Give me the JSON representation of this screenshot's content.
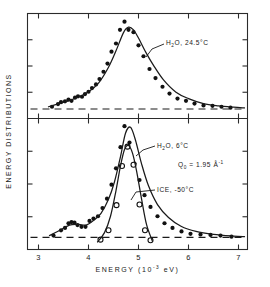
{
  "figure": {
    "title_visible": false,
    "y_axis_label": "ENERGY DISTRIBUTIONS",
    "x_axis_label_main": "ENERGY",
    "x_axis_label_unit_open": "(10",
    "x_axis_label_unit_exp": "-3",
    "x_axis_label_unit_close": " eV)",
    "x_ticks": [
      3,
      4,
      5,
      6,
      7
    ],
    "x_tick_labels": [
      "3",
      "4",
      "5",
      "6",
      "7"
    ],
    "x_minor_step": 0.5,
    "x_range": [
      2.78,
      7.18
    ],
    "n_panels": 2
  },
  "annotations": {
    "top_label": {
      "text": "H₂O,  24.5°C",
      "prefix": "H",
      "sub": "2",
      "suffix": "O,  24.5°C"
    },
    "mid_label": {
      "text": "H₂O,  6°C",
      "prefix": "H",
      "sub": "2",
      "suffix": "O,  6°C"
    },
    "q_label": {
      "text": "Q₀ = 1.95 Å⁻¹",
      "symbol": "Q",
      "sub": "0",
      "equals": " = 1.95 ",
      "unit": "Å",
      "exp": "-1"
    },
    "ice_label": {
      "text": "ICE, -50°C"
    }
  },
  "chart_data": [
    {
      "type": "scatter",
      "panel": "top",
      "title": "H₂O, 24.5°C",
      "xlabel": "ENERGY (10^-3 eV)",
      "ylabel": "ENERGY DISTRIBUTIONS",
      "xlim": [
        2.78,
        7.18
      ],
      "ylim": [
        0,
        1.14
      ],
      "grid": false,
      "legend": "none",
      "marker": "filled-circle",
      "baseline_y": 0.06,
      "series": [
        {
          "name": "H2O 24.5C points",
          "marker": "filled-circle",
          "x": [
            3.27,
            3.39,
            3.45,
            3.53,
            3.6,
            3.66,
            3.73,
            3.79,
            3.87,
            3.93,
            4.0,
            4.07,
            4.15,
            4.22,
            4.3,
            4.38,
            4.46,
            4.55,
            4.63,
            4.72,
            4.8,
            4.9,
            5.0,
            5.1,
            5.22,
            5.34,
            5.48,
            5.62,
            5.78,
            5.95,
            6.12,
            6.3,
            6.48,
            6.66,
            6.84
          ],
          "y": [
            0.085,
            0.115,
            0.135,
            0.145,
            0.165,
            0.15,
            0.185,
            0.2,
            0.195,
            0.225,
            0.25,
            0.29,
            0.33,
            0.39,
            0.47,
            0.56,
            0.69,
            0.78,
            0.93,
            1.02,
            0.93,
            0.905,
            0.76,
            0.64,
            0.5,
            0.4,
            0.305,
            0.23,
            0.175,
            0.15,
            0.12,
            0.1,
            0.095,
            0.085,
            0.075
          ]
        },
        {
          "name": "H2O 24.5C fitted curve",
          "type": "line",
          "x": [
            3.2,
            3.4,
            3.6,
            3.8,
            4.0,
            4.2,
            4.4,
            4.55,
            4.7,
            4.8,
            4.9,
            5.0,
            5.15,
            5.3,
            5.5,
            5.75,
            6.0,
            6.3,
            6.6,
            6.9,
            7.12
          ],
          "y": [
            0.085,
            0.118,
            0.15,
            0.192,
            0.25,
            0.345,
            0.52,
            0.7,
            0.9,
            0.96,
            0.93,
            0.84,
            0.68,
            0.54,
            0.38,
            0.245,
            0.175,
            0.12,
            0.095,
            0.08,
            0.072
          ]
        }
      ]
    },
    {
      "type": "scatter",
      "panel": "bottom",
      "title": "H₂O, 6°C and ICE, -50°C",
      "xlabel": "ENERGY (10^-3 eV)",
      "ylabel": "ENERGY DISTRIBUTIONS",
      "xlim": [
        2.78,
        7.18
      ],
      "ylim": [
        0,
        1.14
      ],
      "grid": false,
      "legend": "inline-annotations",
      "baseline_y": 0.07,
      "series": [
        {
          "name": "H2O 6C points",
          "marker": "filled-circle",
          "x": [
            3.3,
            3.45,
            3.53,
            3.6,
            3.66,
            3.72,
            3.78,
            3.86,
            3.94,
            4.02,
            4.1,
            4.19,
            4.28,
            4.37,
            4.46,
            4.55,
            4.64,
            4.72,
            4.82,
            4.92,
            5.02,
            5.12,
            5.24,
            5.38,
            5.52,
            5.68,
            5.86,
            6.04,
            6.24,
            6.44,
            6.64,
            6.86
          ],
          "y": [
            0.085,
            0.13,
            0.15,
            0.19,
            0.2,
            0.195,
            0.175,
            0.16,
            0.16,
            0.21,
            0.23,
            0.25,
            0.32,
            0.4,
            0.52,
            0.66,
            0.84,
            1.02,
            0.88,
            0.7,
            0.56,
            0.43,
            0.33,
            0.25,
            0.19,
            0.15,
            0.12,
            0.1,
            0.095,
            0.09,
            0.085,
            0.075
          ]
        },
        {
          "name": "H2O 6C fitted curve",
          "type": "line",
          "x": [
            3.22,
            3.45,
            3.62,
            3.8,
            3.95,
            4.1,
            4.25,
            4.4,
            4.52,
            4.64,
            4.74,
            4.84,
            4.94,
            5.06,
            5.2,
            5.38,
            5.6,
            5.85,
            6.15,
            6.5,
            6.9,
            7.12
          ],
          "y": [
            0.085,
            0.135,
            0.175,
            0.18,
            0.175,
            0.215,
            0.275,
            0.395,
            0.545,
            0.76,
            0.96,
            1.01,
            0.9,
            0.7,
            0.51,
            0.35,
            0.24,
            0.165,
            0.12,
            0.095,
            0.08,
            0.075
          ]
        },
        {
          "name": "ICE -50C points",
          "marker": "open-circle",
          "x": [
            4.24,
            4.4,
            4.56,
            4.67,
            4.78,
            4.9,
            5.02,
            5.13,
            5.24
          ],
          "y": [
            0.05,
            0.13,
            0.345,
            0.68,
            0.845,
            0.69,
            0.35,
            0.13,
            0.045
          ]
        },
        {
          "name": "ICE -50C fitted curve",
          "type": "line",
          "x": [
            4.18,
            4.32,
            4.44,
            4.55,
            4.64,
            4.72,
            4.8,
            4.88,
            4.96,
            5.06,
            5.16,
            5.28
          ],
          "y": [
            0.03,
            0.11,
            0.25,
            0.47,
            0.68,
            0.82,
            0.855,
            0.79,
            0.64,
            0.4,
            0.18,
            0.035
          ]
        }
      ]
    }
  ]
}
